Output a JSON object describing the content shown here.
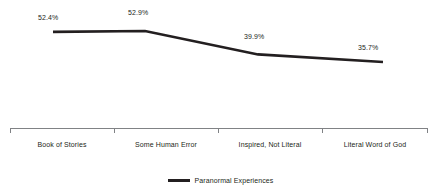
{
  "chart_data": {
    "type": "line",
    "title": "",
    "subtitle": "",
    "xlabel": "",
    "ylabel": "",
    "grid": false,
    "legend_position": "bottom-center",
    "ylim": [
      0,
      60
    ],
    "categories": [
      "Book of Stories",
      "Some Human Error",
      "Inspired, Not Literal",
      "Literal Word of God"
    ],
    "series": [
      {
        "name": "Paranormal Experiences",
        "color": "#231f20",
        "values": [
          52.4,
          52.9,
          39.9,
          35.7
        ],
        "point_labels": [
          "52.4%",
          "52.9%",
          "39.9%",
          "35.7%"
        ]
      }
    ]
  },
  "labels": {
    "p0": "52.4%",
    "p1": "52.9%",
    "p2": "39.9%",
    "p3": "35.7%"
  },
  "categories": {
    "c0": "Book of Stories",
    "c1": "Some Human Error",
    "c2": "Inspired, Not Literal",
    "c3": "Literal Word of God"
  },
  "legend": {
    "series_label": "Paranormal Experiences"
  },
  "colors": {
    "line": "#231f20",
    "axis": "#6d6e71",
    "text": "#231f20",
    "background": "#ffffff"
  }
}
